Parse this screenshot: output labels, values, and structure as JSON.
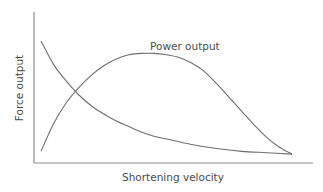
{
  "chart_data": {
    "type": "line",
    "title": "",
    "xlabel": "Shortening velocity",
    "ylabel": "Force output",
    "xlim": [
      0,
      1
    ],
    "ylim": [
      0,
      1
    ],
    "grid": false,
    "ticks": "none",
    "annotations": [
      {
        "text": "Power output",
        "series": "Power output"
      }
    ],
    "series": [
      {
        "name": "Force output",
        "x": [
          0.0,
          0.05,
          0.1,
          0.15,
          0.2,
          0.25,
          0.3,
          0.35,
          0.4,
          0.45,
          0.5,
          0.6,
          0.7,
          0.8,
          0.9,
          1.0
        ],
        "y": [
          0.87,
          0.7,
          0.58,
          0.48,
          0.4,
          0.34,
          0.29,
          0.25,
          0.21,
          0.18,
          0.16,
          0.12,
          0.09,
          0.07,
          0.06,
          0.05
        ]
      },
      {
        "name": "Power output",
        "x": [
          0.0,
          0.05,
          0.1,
          0.15,
          0.2,
          0.25,
          0.3,
          0.35,
          0.4,
          0.45,
          0.5,
          0.55,
          0.6,
          0.65,
          0.7,
          0.75,
          0.8,
          0.85,
          0.9,
          0.95,
          1.0
        ],
        "y": [
          0.07,
          0.27,
          0.42,
          0.53,
          0.62,
          0.69,
          0.74,
          0.77,
          0.78,
          0.78,
          0.77,
          0.75,
          0.71,
          0.65,
          0.56,
          0.46,
          0.36,
          0.26,
          0.17,
          0.1,
          0.05
        ]
      }
    ]
  }
}
